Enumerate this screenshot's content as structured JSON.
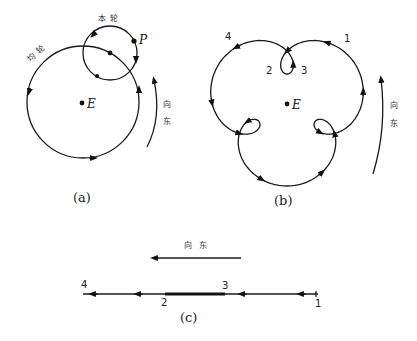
{
  "figure_a": {
    "caption": "(a)",
    "deferent_label": "均轮",
    "epicycle_label": "本轮",
    "planet_label": "P",
    "earth_label": "E",
    "direction_label_1": "向",
    "direction_label_2": "东"
  },
  "figure_b": {
    "caption": "(b)",
    "earth_label": "E",
    "point_labels": [
      "1",
      "2",
      "3",
      "4"
    ],
    "direction_label_1": "向",
    "direction_label_2": "东"
  },
  "figure_c": {
    "caption": "(c)",
    "direction_label": "向 东",
    "point_labels": [
      "1",
      "2",
      "3",
      "4"
    ]
  }
}
